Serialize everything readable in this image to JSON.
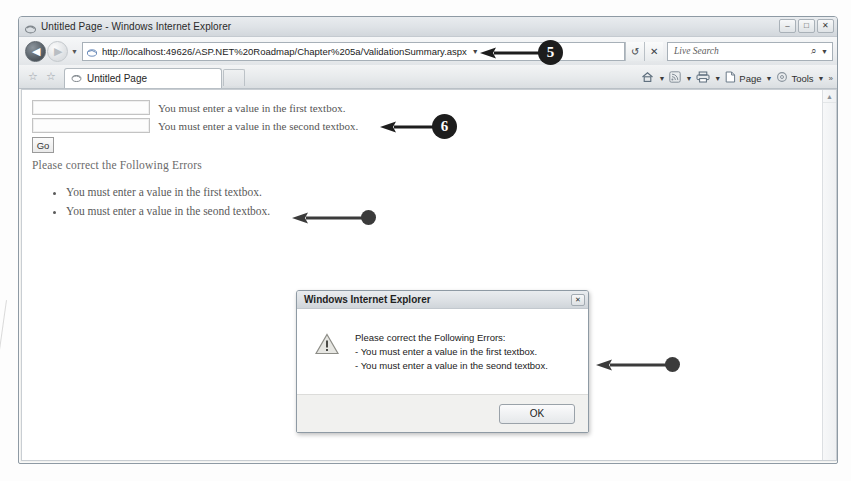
{
  "browser": {
    "window_title": "Untitled Page - Windows Internet Explorer",
    "title_icon": "ie-favicon-icon",
    "window_controls": {
      "minimize": "–",
      "maximize": "□",
      "close": "✕"
    },
    "navigation": {
      "back_label": "◀",
      "forward_label": "▶",
      "history_caret": "▼"
    },
    "address_bar": {
      "url": "http://localhost:49626/ASP.NET%20Roadmap/Chapter%205a/ValidationSummary.aspx",
      "page_icon": "page-favicon-icon",
      "dropdown_caret": "▼",
      "refresh_icon": "↺",
      "stop_icon": "✕"
    },
    "search": {
      "placeholder": "Live Search",
      "search_icon": "⌕",
      "provider_caret": "▼"
    },
    "tabs": {
      "favorites_add_icon": "☆",
      "favorites_center_icon": "☆",
      "items": [
        {
          "label": "Untitled Page",
          "icon": "ie-favicon-icon",
          "active": true
        }
      ],
      "new_tab_label": ""
    },
    "command_bar": {
      "items": [
        {
          "label": "",
          "icon": "home-icon",
          "caret": "▼"
        },
        {
          "label": "",
          "icon": "rss-feed-icon",
          "caret": "▼"
        },
        {
          "label": "",
          "icon": "print-icon",
          "caret": "▼"
        },
        {
          "label": "Page",
          "icon": "page-icon",
          "caret": "▼"
        },
        {
          "label": "Tools",
          "icon": "tools-icon",
          "caret": "▼"
        }
      ],
      "overflow": "»"
    },
    "scrollbar": {
      "up_arrow": "▲"
    }
  },
  "page": {
    "fields": [
      {
        "value": "",
        "validation_message": "You must enter a value in the first textbox."
      },
      {
        "value": "",
        "validation_message": "You must enter a value in the second textbox."
      }
    ],
    "submit_label": "Go",
    "summary_heading": "Please correct the Following Errors",
    "summary_items": [
      "You must enter a value in the first textbox.",
      "You must enter a value in the seond textbox."
    ]
  },
  "dialog": {
    "title": "Windows Internet Explorer",
    "icon": "warning-icon",
    "close_label": "✕",
    "heading": "Please correct the Following Errors:",
    "lines": [
      "- You must enter a value in the first textbox.",
      "- You must enter a value in the seond textbox."
    ],
    "ok_label": "OK"
  },
  "annotations": {
    "callout_5": "5",
    "callout_6": "6",
    "callout_bullet_1": "",
    "callout_bullet_2": ""
  },
  "colors": {
    "callout_fill": "#1d1d1d",
    "callout_text": "#ffffff",
    "window_chrome": "#e7eaec",
    "page_background": "#ffffff"
  }
}
